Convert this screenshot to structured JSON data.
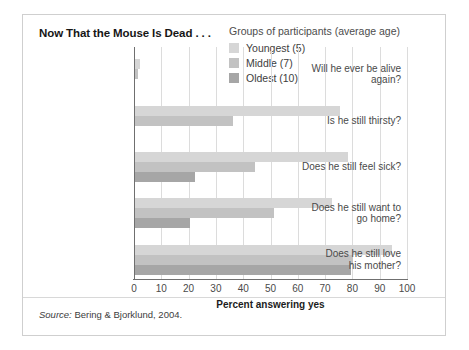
{
  "figure": {
    "title": "Now That the Mouse Is Dead . . .",
    "source_prefix": "Source:",
    "source_text": " Bering & Bjorklund, 2004."
  },
  "legend": {
    "title": "Groups of participants (average age)",
    "items": [
      {
        "label": "Youngest (5)",
        "color": "#d6d6d6",
        "swatch_name": "legend-swatch-youngest"
      },
      {
        "label": "Middle (7)",
        "color": "#c2c2c2",
        "swatch_name": "legend-swatch-middle"
      },
      {
        "label": "Oldest (10)",
        "color": "#a6a6a6",
        "swatch_name": "legend-swatch-oldest"
      }
    ]
  },
  "axis": {
    "x_title": "Percent answering yes",
    "ticks": [
      "0",
      "10",
      "20",
      "30",
      "40",
      "50",
      "60",
      "70",
      "80",
      "90",
      "100"
    ]
  },
  "categories": [
    {
      "line1": "Will he ever be alive",
      "line2": "again?"
    },
    {
      "line1": "Is he still thirsty?",
      "line2": ""
    },
    {
      "line1": "Does he still feel sick?",
      "line2": ""
    },
    {
      "line1": "Does he still want to",
      "line2": "go home?"
    },
    {
      "line1": "Does he still love",
      "line2": "his mother?"
    }
  ],
  "chart_data": {
    "type": "bar",
    "orientation": "horizontal",
    "title": "Now That the Mouse Is Dead . . .",
    "xlabel": "Percent answering yes",
    "ylabel": "",
    "xlim": [
      0,
      100
    ],
    "xticks": [
      0,
      10,
      20,
      30,
      40,
      50,
      60,
      70,
      80,
      90,
      100
    ],
    "grid": "vertical",
    "legend_position": "top-right",
    "legend_title": "Groups of participants (average age)",
    "categories": [
      "Will he ever be alive again?",
      "Is he still thirsty?",
      "Does he still feel sick?",
      "Does he still want to go home?",
      "Does he still love his mother?"
    ],
    "series": [
      {
        "name": "Youngest (5)",
        "color": "#d6d6d6",
        "values": [
          2,
          75,
          78,
          72,
          94
        ]
      },
      {
        "name": "Middle (7)",
        "color": "#c2c2c2",
        "values": [
          1,
          36,
          44,
          51,
          80
        ]
      },
      {
        "name": "Oldest (10)",
        "color": "#a6a6a6",
        "values": [
          0,
          0,
          22,
          20,
          79
        ]
      }
    ],
    "source": "Source: Bering & Bjorklund, 2004."
  }
}
